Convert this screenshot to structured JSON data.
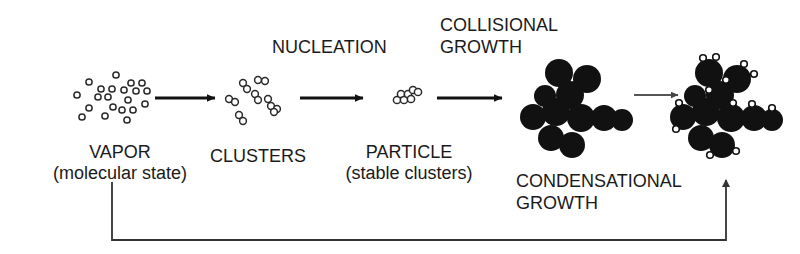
{
  "figure": {
    "type": "process-flow-diagram",
    "background_color": "#ffffff",
    "ink_color": "#1a1a1a"
  },
  "stages": [
    {
      "id": "vapor",
      "name": "VAPOR",
      "sublabel": "(molecular state)",
      "depiction": "scattered small open circles (monomers)",
      "particle_style": "open",
      "particle_count": 21,
      "center_x": 120,
      "center_y": 98
    },
    {
      "id": "clusters",
      "name": "CLUSTERS",
      "sublabel": "",
      "depiction": "small groups of 2-3 joined open circles",
      "particle_style": "open",
      "particle_count": 14,
      "center_x": 258,
      "center_y": 98
    },
    {
      "id": "particle",
      "name": "PARTICLE",
      "sublabel": "(stable clusters)",
      "depiction": "compact group of ~7 joined open circles",
      "particle_style": "open",
      "particle_count": 7,
      "center_x": 406,
      "center_y": 96
    },
    {
      "id": "agglomerate",
      "name": "",
      "sublabel": "",
      "depiction": "chain agglomerate of large filled black spheres",
      "particle_style": "filled",
      "particle_count": 11,
      "center_x": 572,
      "center_y": 103
    },
    {
      "id": "coated-agglomerate",
      "name": "",
      "sublabel": "",
      "depiction": "chain agglomerate of large filled black spheres with condensed monomers attached",
      "particle_style": "filled-with-monomers",
      "particle_count": 11,
      "monomer_count": 12,
      "center_x": 722,
      "center_y": 103
    }
  ],
  "process_labels": [
    {
      "id": "nucleation",
      "text": "NUCLEATION",
      "x": 272,
      "y": 36
    },
    {
      "id": "collisional-growth",
      "text": "COLLISIONAL\nGROWTH",
      "x": 440,
      "y": 14
    },
    {
      "id": "condensational-growth",
      "text": "CONDENSATIONAL\nGROWTH",
      "x": 516,
      "y": 172
    }
  ],
  "stage_labels": [
    {
      "id": "vapor-label",
      "line1": "VAPOR",
      "line2": "(molecular state)",
      "x": 120,
      "y": 142
    },
    {
      "id": "clusters-label",
      "line1": "CLUSTERS",
      "line2": "",
      "x": 258,
      "y": 146
    },
    {
      "id": "particle-label",
      "line1": "PARTICLE",
      "line2": "(stable clusters)",
      "x": 408,
      "y": 142
    }
  ],
  "arrows": [
    {
      "id": "arrow-vapor-to-clusters",
      "from": "vapor",
      "to": "clusters",
      "x1": 155,
      "y1": 98,
      "x2": 218,
      "y2": 98,
      "weight": "heavy"
    },
    {
      "id": "arrow-clusters-to-particle",
      "from": "clusters",
      "to": "particle",
      "x1": 300,
      "y1": 98,
      "x2": 366,
      "y2": 98,
      "weight": "heavy"
    },
    {
      "id": "arrow-particle-to-agglomerate",
      "from": "particle",
      "to": "agglomerate",
      "x1": 437,
      "y1": 98,
      "x2": 505,
      "y2": 98,
      "weight": "heavy"
    },
    {
      "id": "arrow-agglomerate-to-coated",
      "from": "agglomerate",
      "to": "coated-agglomerate",
      "x1": 630,
      "y1": 95,
      "x2": 684,
      "y2": 95,
      "weight": "light"
    },
    {
      "id": "feedback-loop-arrow",
      "from": "vapor",
      "to": "coated-agglomerate",
      "description": "return path from vapor label down, across bottom, and up to condensational growth stage",
      "path": "M 112,182 L 112,240 L 726,240 L 726,178",
      "weight": "light"
    }
  ]
}
